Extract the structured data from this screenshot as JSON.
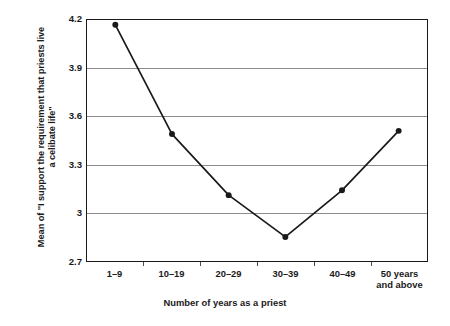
{
  "chart_data": {
    "type": "line",
    "title": "",
    "subtitle": "",
    "xlabel": "Number of years as a priest",
    "ylabel": "Mean of \"I support the requirement that priests live a celibate life\"",
    "ylabel_line1": "Mean of \"I support the requirement that priests live",
    "ylabel_line2": "a celibate life\"",
    "categories": [
      "1–9",
      "10–19",
      "20–29",
      "30–39",
      "40–49",
      "50 years\nand above"
    ],
    "values": [
      4.17,
      3.49,
      3.11,
      2.85,
      3.14,
      3.51
    ],
    "ylim": [
      2.7,
      4.2
    ],
    "yticks": [
      4.2,
      3.9,
      3.6,
      3.3,
      3,
      2.7
    ],
    "ytick_labels": [
      "4.2",
      "3.9",
      "3.6",
      "3.3",
      "3",
      "2.7"
    ],
    "grid": "horizontal",
    "legend": "none",
    "marker": "filled-circle",
    "line_color": "#1a1a1a",
    "marker_color": "#1a1a1a",
    "grid_color": "#8c8c8c",
    "background": "#ffffff"
  }
}
